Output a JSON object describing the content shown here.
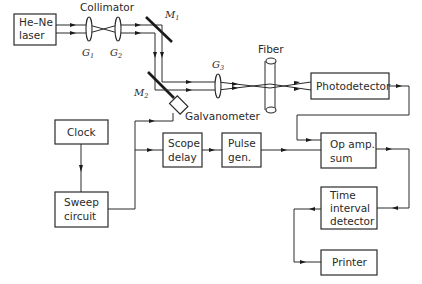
{
  "diagram": {
    "components": {
      "laser": {
        "line1": "He–Ne",
        "line2": "laser"
      },
      "collimator": {
        "label": "Collimator"
      },
      "lens_g1": {
        "label": "G",
        "sub": "1"
      },
      "lens_g2": {
        "label": "G",
        "sub": "2"
      },
      "lens_g3": {
        "label": "G",
        "sub": "3"
      },
      "mirror_m1": {
        "label": "M",
        "sub": "1"
      },
      "mirror_m2": {
        "label": "M",
        "sub": "2"
      },
      "galvanometer": {
        "label": "Galvanometer"
      },
      "fiber": {
        "label": "Fiber"
      },
      "photodetector": {
        "label": "Photodetector"
      },
      "clock": {
        "label": "Clock"
      },
      "sweep": {
        "line1": "Sweep",
        "line2": "circuit"
      },
      "scope_delay": {
        "line1": "Scope",
        "line2": "delay"
      },
      "pulse_gen": {
        "line1": "Pulse",
        "line2": "gen."
      },
      "op_amp": {
        "line1": "Op amp.",
        "line2": "sum"
      },
      "time_interval": {
        "line1": "Time",
        "line2": "interval",
        "line3": "detector"
      },
      "printer": {
        "label": "Printer"
      }
    },
    "connections": [
      {
        "from": "He-Ne laser",
        "to": "Collimator"
      },
      {
        "from": "Collimator",
        "to": "M1"
      },
      {
        "from": "M1",
        "to": "M2"
      },
      {
        "from": "M2",
        "to": "G3"
      },
      {
        "from": "G3",
        "to": "Fiber"
      },
      {
        "from": "Fiber",
        "to": "Photodetector"
      },
      {
        "from": "Photodetector",
        "to": "Op amp. sum"
      },
      {
        "from": "Clock",
        "to": "Sweep circuit"
      },
      {
        "from": "Sweep circuit",
        "to": "Galvanometer"
      },
      {
        "from": "Sweep circuit",
        "to": "Scope delay"
      },
      {
        "from": "Scope delay",
        "to": "Pulse gen."
      },
      {
        "from": "Pulse gen.",
        "to": "Op amp. sum"
      },
      {
        "from": "Op amp. sum",
        "to": "Time interval detector"
      },
      {
        "from": "Time interval detector",
        "to": "Printer"
      }
    ]
  }
}
